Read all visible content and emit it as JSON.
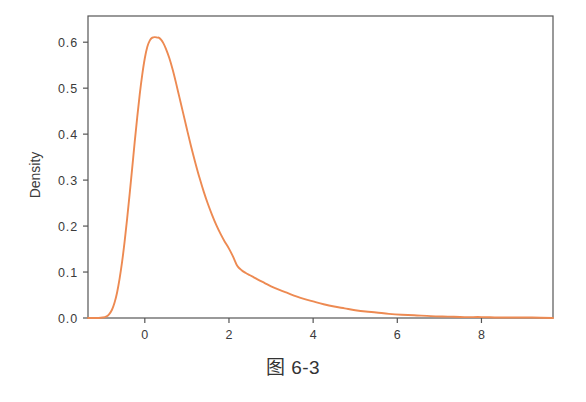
{
  "figure": {
    "caption": "图 6-3",
    "background_color": "#ffffff"
  },
  "chart_data": {
    "type": "line",
    "title": "",
    "subtitle": "",
    "xlabel": "",
    "ylabel": "Density",
    "line_color": "#ed8a52",
    "axis_color": "#555555",
    "text_color": "#3b3b3b",
    "grid": false,
    "legend": false,
    "legend_position": "none",
    "xlim": [
      -1.35,
      9.7
    ],
    "ylim": [
      0.0,
      0.657
    ],
    "xticks": [
      0,
      2,
      4,
      6,
      8
    ],
    "xtick_labels": [
      "0",
      "2",
      "4",
      "6",
      "8"
    ],
    "yticks": [
      0.0,
      0.1,
      0.2,
      0.3,
      0.4,
      0.5,
      0.6
    ],
    "ytick_labels": [
      "0.0",
      "0.1",
      "0.2",
      "0.3",
      "0.4",
      "0.5",
      "0.6"
    ],
    "series": [
      {
        "name": "Density",
        "color": "#ed8a52",
        "x": [
          -1.35,
          -1.2,
          -1.1,
          -1.0,
          -0.92,
          -0.85,
          -0.78,
          -0.72,
          -0.66,
          -0.6,
          -0.54,
          -0.48,
          -0.42,
          -0.36,
          -0.3,
          -0.24,
          -0.18,
          -0.12,
          -0.06,
          0.0,
          0.06,
          0.12,
          0.18,
          0.24,
          0.3,
          0.33,
          0.38,
          0.44,
          0.5,
          0.58,
          0.66,
          0.74,
          0.82,
          0.9,
          1.0,
          1.1,
          1.2,
          1.3,
          1.4,
          1.5,
          1.6,
          1.7,
          1.8,
          1.9,
          2.0,
          2.1,
          2.2,
          2.3,
          2.4,
          2.5,
          2.6,
          2.7,
          2.85,
          3.0,
          3.2,
          3.4,
          3.6,
          3.8,
          4.0,
          4.25,
          4.5,
          4.75,
          5.0,
          5.25,
          5.5,
          5.8,
          6.1,
          6.4,
          6.8,
          7.2,
          7.6,
          8.0,
          8.4,
          8.8,
          9.2,
          9.7
        ],
        "y": [
          0.0,
          0.0,
          0.0,
          0.001,
          0.003,
          0.008,
          0.018,
          0.033,
          0.055,
          0.085,
          0.122,
          0.166,
          0.216,
          0.27,
          0.326,
          0.383,
          0.437,
          0.487,
          0.53,
          0.565,
          0.59,
          0.604,
          0.61,
          0.611,
          0.61,
          0.61,
          0.606,
          0.598,
          0.586,
          0.566,
          0.541,
          0.512,
          0.481,
          0.45,
          0.411,
          0.373,
          0.338,
          0.305,
          0.275,
          0.248,
          0.224,
          0.202,
          0.183,
          0.166,
          0.151,
          0.133,
          0.113,
          0.104,
          0.098,
          0.093,
          0.088,
          0.083,
          0.076,
          0.069,
          0.061,
          0.054,
          0.047,
          0.041,
          0.036,
          0.03,
          0.025,
          0.021,
          0.017,
          0.014,
          0.012,
          0.009,
          0.007,
          0.006,
          0.004,
          0.003,
          0.002,
          0.002,
          0.001,
          0.001,
          0.001,
          0.0
        ],
        "peak": {
          "x": 0.33,
          "y": 0.611
        },
        "shoulder": {
          "x": 2.2,
          "y": 0.113
        }
      }
    ]
  }
}
